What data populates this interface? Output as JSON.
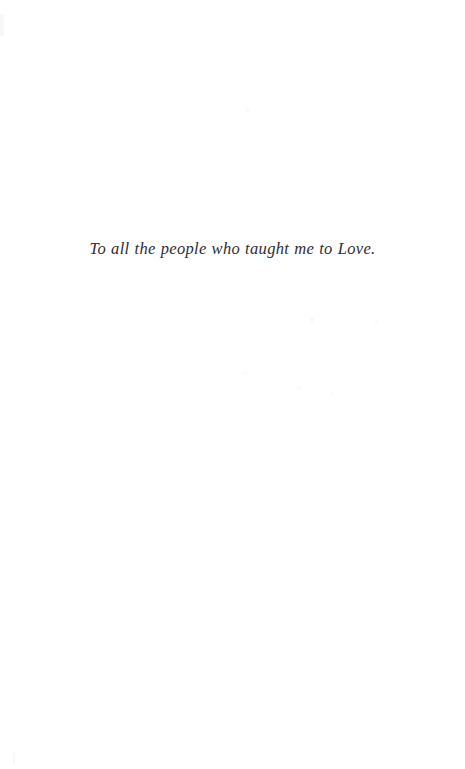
{
  "page": {
    "kind": "book-dedication-page",
    "background_color": "#ffffff",
    "width_px": 465,
    "height_px": 769
  },
  "dedication": {
    "text": "To all the people who taught me to Love.",
    "style": "italic-serif",
    "alignment": "center",
    "text_color": "#2d2d33"
  },
  "artifacts": {
    "description": "faint scanner specks and page-edge shading",
    "color": "#fafafa"
  }
}
